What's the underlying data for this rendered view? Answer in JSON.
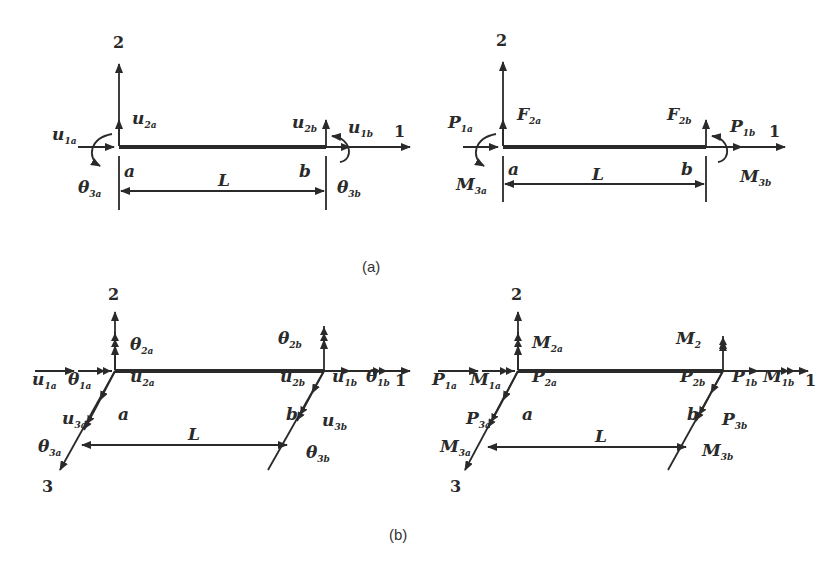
{
  "figure": {
    "captions": {
      "a": "(a)",
      "b": "(b)"
    },
    "panel_a": {
      "left": {
        "axis_1": "1",
        "axis_2": "2",
        "node_a": "a",
        "node_b": "b",
        "length": "L",
        "labels": [
          {
            "main": "u",
            "sub": "1a"
          },
          {
            "main": "u",
            "sub": "2a"
          },
          {
            "main": "θ",
            "sub": "3a"
          },
          {
            "main": "u",
            "sub": "2b"
          },
          {
            "main": "u",
            "sub": "1b"
          },
          {
            "main": "θ",
            "sub": "3b"
          }
        ]
      },
      "right": {
        "axis_1": "1",
        "axis_2": "2",
        "node_a": "a",
        "node_b": "b",
        "length": "L",
        "labels": [
          {
            "main": "P",
            "sub": "1a"
          },
          {
            "main": "F",
            "sub": "2a"
          },
          {
            "main": "M",
            "sub": "3a"
          },
          {
            "main": "F",
            "sub": "2b"
          },
          {
            "main": "P",
            "sub": "1b"
          },
          {
            "main": "M",
            "sub": "3b"
          }
        ]
      }
    },
    "panel_b": {
      "left": {
        "axis_1": "1",
        "axis_2": "2",
        "axis_3": "3",
        "node_a": "a",
        "node_b": "b",
        "length": "L",
        "labels": [
          {
            "main": "u",
            "sub": "1a"
          },
          {
            "main": "θ",
            "sub": "1a"
          },
          {
            "main": "θ",
            "sub": "2a"
          },
          {
            "main": "u",
            "sub": "2a"
          },
          {
            "main": "u",
            "sub": "3a"
          },
          {
            "main": "θ",
            "sub": "3a"
          },
          {
            "main": "θ",
            "sub": "2b"
          },
          {
            "main": "u",
            "sub": "2b"
          },
          {
            "main": "u",
            "sub": "1b"
          },
          {
            "main": "θ",
            "sub": "1b"
          },
          {
            "main": "u",
            "sub": "3b"
          },
          {
            "main": "θ",
            "sub": "3b"
          }
        ]
      },
      "right": {
        "axis_1": "1",
        "axis_2": "2",
        "axis_3": "3",
        "node_a": "a",
        "node_b": "b",
        "length": "L",
        "labels": [
          {
            "main": "P",
            "sub": "1a"
          },
          {
            "main": "M",
            "sub": "1a"
          },
          {
            "main": "M",
            "sub": "2a"
          },
          {
            "main": "P",
            "sub": "2a"
          },
          {
            "main": "P",
            "sub": "3a"
          },
          {
            "main": "M",
            "sub": "3a"
          },
          {
            "main": "M",
            "sub": "2"
          },
          {
            "main": "P",
            "sub": "2b"
          },
          {
            "main": "P",
            "sub": "1b"
          },
          {
            "main": "M",
            "sub": "1b"
          },
          {
            "main": "P",
            "sub": "3b"
          },
          {
            "main": "M",
            "sub": "3b"
          }
        ]
      }
    }
  }
}
